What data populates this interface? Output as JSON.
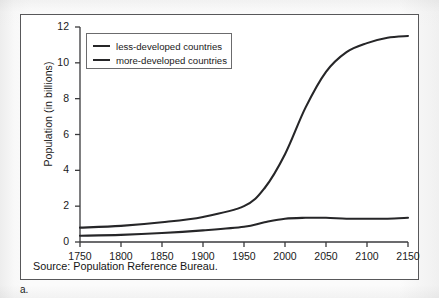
{
  "figure": {
    "label": "a.",
    "source_note": "Source: Population Reference Bureau."
  },
  "colors": {
    "line": "#262628",
    "axis": "#3a3a3c",
    "frame": "#58585a",
    "text": "#1a1a1a",
    "plot_background": "#ffffff"
  },
  "chart_data": {
    "type": "line",
    "title": "",
    "xlabel": "",
    "ylabel": "Population (in billions)",
    "xlim": [
      1750,
      2150
    ],
    "ylim": [
      0,
      12
    ],
    "xticks": [
      1750,
      1800,
      1850,
      1900,
      1950,
      2000,
      2050,
      2100,
      2150
    ],
    "yticks": [
      0,
      2,
      4,
      6,
      8,
      10,
      12
    ],
    "grid": false,
    "legend_position": "upper-left",
    "x": [
      1750,
      1800,
      1850,
      1900,
      1950,
      1975,
      2000,
      2025,
      2050,
      2075,
      2100,
      2125,
      2150
    ],
    "series": [
      {
        "name": "less-developed countries",
        "values": [
          0.8,
          0.9,
          1.1,
          1.4,
          2.0,
          3.0,
          4.9,
          7.5,
          9.5,
          10.6,
          11.1,
          11.4,
          11.5
        ]
      },
      {
        "name": "more-developed countries",
        "values": [
          0.35,
          0.4,
          0.5,
          0.65,
          0.85,
          1.1,
          1.3,
          1.35,
          1.35,
          1.3,
          1.3,
          1.3,
          1.35
        ]
      }
    ]
  },
  "legend": {
    "items": [
      {
        "label": "less-developed countries"
      },
      {
        "label": "more-developed countries"
      }
    ]
  }
}
